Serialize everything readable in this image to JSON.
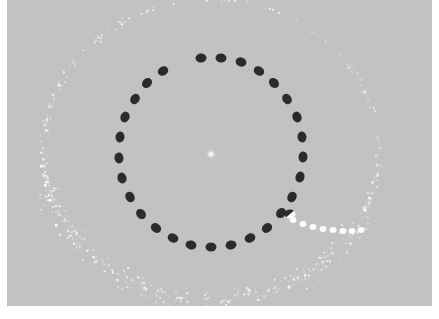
{
  "image": {
    "kind": "scientific-photograph",
    "caption": "Circular array of dark markers with faint outer speckled ring",
    "width": 439,
    "height": 319
  },
  "canvas": {
    "background_color": "#ffffff",
    "plate_color": "#c6c6c6",
    "plate_left": 7,
    "plate_top": 0,
    "plate_width": 425,
    "plate_height": 306
  },
  "colors": {
    "background": "#c6c6c6",
    "dark_marker": "#2b2b2b",
    "white_marker": "#fbfbfb",
    "outer_ring": "#ffffff",
    "center_point": "#f2f2f2",
    "border": "#ffffff"
  },
  "center_point": {
    "label": "center-reference-point",
    "x": 204,
    "y": 154,
    "diameter": 5,
    "color": "#f2f2f2"
  },
  "inner_ring": {
    "label": "dark-dotted-ring",
    "center_x": 204,
    "center_y": 152,
    "radius_x": 92,
    "radius_y": 95,
    "marker_count": 28,
    "marker_width": 11,
    "marker_height": 9,
    "marker_color": "#2b2b2b",
    "start_angle_deg": -96,
    "sweep_deg": 347
  },
  "white_trail": {
    "label": "white-dotted-trail",
    "marker_count": 8,
    "marker_color": "#fbfbfb",
    "marker_width": 7,
    "marker_height": 6,
    "points": [
      [
        286,
        220
      ],
      [
        296,
        224
      ],
      [
        306,
        227
      ],
      [
        316,
        229
      ],
      [
        326,
        230
      ],
      [
        336,
        231
      ],
      [
        345,
        231
      ],
      [
        354,
        230
      ]
    ]
  },
  "transition_marker": {
    "label": "half-dark-half-white-marker",
    "x": 283,
    "y": 214,
    "width": 11,
    "height": 9
  },
  "outer_ring": {
    "label": "faint-speckled-outer-ring",
    "center_x": 204,
    "center_y": 150,
    "radius_x": 168,
    "radius_y": 150,
    "color": "#ffffff",
    "description": "diffuse scattered white speckle band, densest along lower arc"
  },
  "chart_data": {
    "type": "scatter",
    "xlabel": "",
    "ylabel": "",
    "series": [
      {
        "name": "dark markers",
        "color": "#2b2b2b",
        "count": 28
      },
      {
        "name": "white trail markers",
        "color": "#fbfbfb",
        "count": 8
      },
      {
        "name": "outer speckle ring",
        "color": "#ffffff",
        "count": 900
      }
    ]
  }
}
